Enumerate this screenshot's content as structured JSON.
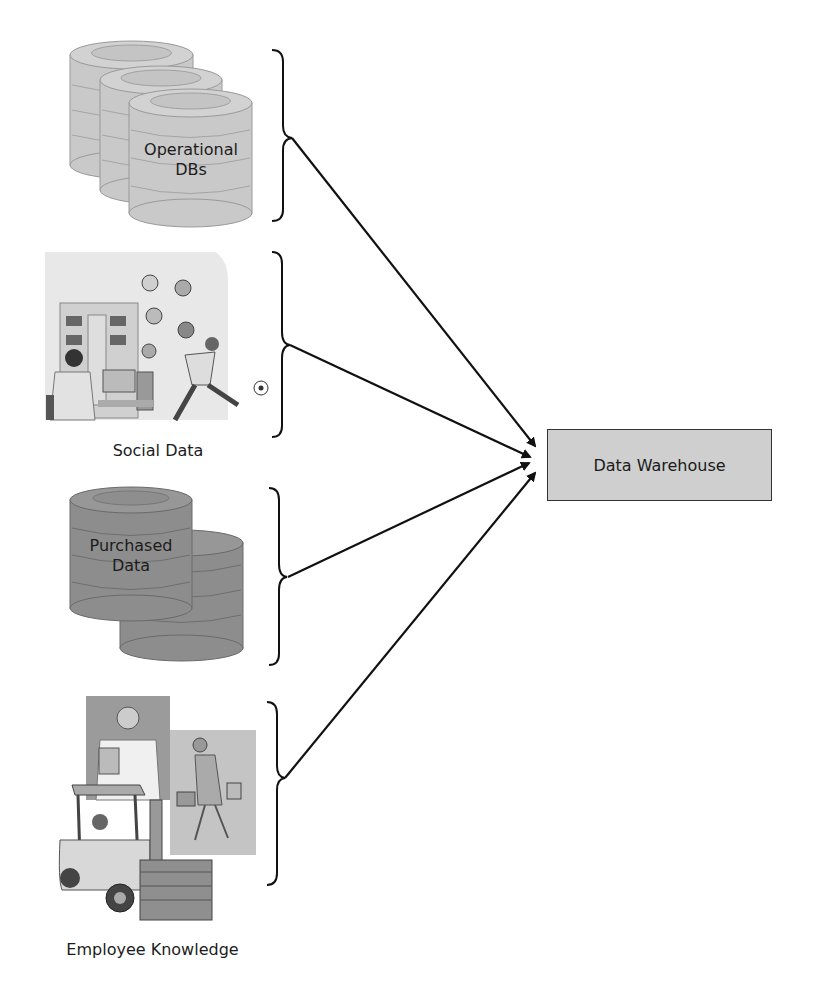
{
  "diagram": {
    "sources": [
      {
        "id": "operational",
        "label": "Operational DBs",
        "label_lines": [
          "Operational",
          "DBs"
        ],
        "icon": "stacked-database-icon",
        "fill": "#c8c8c8"
      },
      {
        "id": "social",
        "label": "Social Data",
        "icon": "social-people-illustration"
      },
      {
        "id": "purchased",
        "label": "Purchased Data",
        "label_lines": [
          "Purchased",
          "Data"
        ],
        "icon": "stacked-database-icon",
        "fill": "#8c8c8c"
      },
      {
        "id": "employee",
        "label": "Employee Knowledge",
        "icon": "employees-illustration"
      }
    ],
    "target": {
      "label": "Data Warehouse",
      "fill": "#cfcfcf"
    },
    "edges": [
      {
        "from": "operational",
        "to": "Data Warehouse"
      },
      {
        "from": "social",
        "to": "Data Warehouse"
      },
      {
        "from": "purchased",
        "to": "Data Warehouse"
      },
      {
        "from": "employee",
        "to": "Data Warehouse"
      }
    ]
  }
}
